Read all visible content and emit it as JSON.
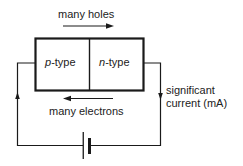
{
  "diagram": {
    "regions": [
      {
        "italic": "p",
        "suffix": "-type"
      },
      {
        "italic": "n",
        "suffix": "-type"
      }
    ],
    "top_label": "many holes",
    "bottom_label": "many electrons",
    "current_label_line1": "significant",
    "current_label_line2": "current (mA)",
    "colors": {
      "line": "#1a1a1a",
      "background": "#ffffff"
    }
  }
}
